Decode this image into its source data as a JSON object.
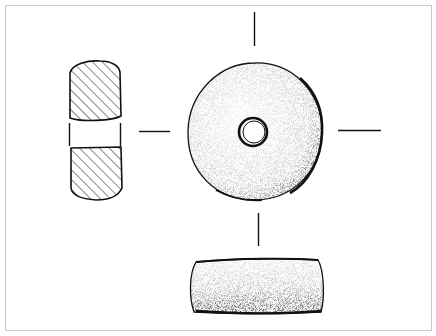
{
  "figure": {
    "views": [
      "cross-section",
      "plan view",
      "side elevation"
    ],
    "colors": {
      "ink": "#111111",
      "frame": "#c8c8c8",
      "background": "#ffffff"
    }
  }
}
